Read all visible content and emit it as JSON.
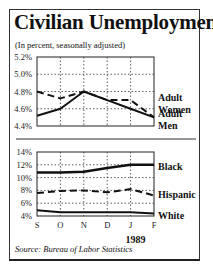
{
  "title": "Civilian Unemployment",
  "subtitle": "(In percent, seasonally adjusted)",
  "source": "Source: Bureau of Labor Statistics",
  "year_label": "1989",
  "chart_data": [
    {
      "type": "line",
      "title": "Civilian Unemployment — Adults",
      "xlabel": "",
      "ylabel": "Percent",
      "categories": [
        "S",
        "O",
        "N",
        "D",
        "J",
        "F"
      ],
      "y_ticks": [
        "5.2%",
        "5.0%",
        "4.8%",
        "4.6%",
        "4.4%"
      ],
      "ylim": [
        4.4,
        5.2
      ],
      "grid": true,
      "legend_position": "right (inline labels)",
      "series": [
        {
          "name": "Adult Women",
          "style": "dashed",
          "values": [
            4.8,
            4.72,
            4.8,
            4.7,
            4.7,
            4.5
          ]
        },
        {
          "name": "Adult Men",
          "style": "solid",
          "values": [
            4.52,
            4.6,
            4.8,
            4.7,
            4.6,
            4.5
          ]
        }
      ]
    },
    {
      "type": "line",
      "title": "Civilian Unemployment — By Race/Ethnicity",
      "xlabel": "1989",
      "ylabel": "Percent",
      "categories": [
        "S",
        "O",
        "N",
        "D",
        "J",
        "F"
      ],
      "y_ticks": [
        "14%",
        "12%",
        "10%",
        "8%",
        "6%",
        "4%"
      ],
      "ylim": [
        4,
        14
      ],
      "grid": true,
      "legend_position": "right (inline labels)",
      "series": [
        {
          "name": "Black",
          "style": "solid-thick",
          "values": [
            10.8,
            10.8,
            10.9,
            11.5,
            12.0,
            12.0
          ]
        },
        {
          "name": "Hispanic",
          "style": "dashed",
          "values": [
            7.6,
            7.9,
            8.0,
            7.7,
            8.2,
            7.2
          ]
        },
        {
          "name": "White",
          "style": "solid",
          "values": [
            4.9,
            4.6,
            4.6,
            4.6,
            4.6,
            4.4
          ]
        }
      ]
    }
  ]
}
